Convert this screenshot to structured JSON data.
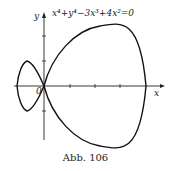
{
  "figure": {
    "equation": "x⁴+y⁴−3x³+4x²=0",
    "y_axis_label": "y",
    "x_axis_label": "x",
    "origin_label": "0",
    "caption": "Abb. 106"
  }
}
